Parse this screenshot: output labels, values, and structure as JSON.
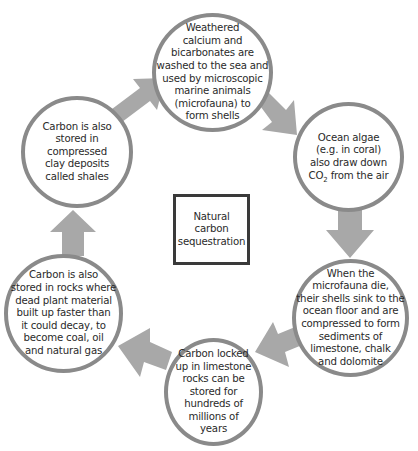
{
  "diagram": {
    "title": "Natural\ncarbon\nsequestration",
    "nodes": [
      {
        "id": "top",
        "text": "Weathered\ncalcium and\nbicarbonates are\nwashed to the sea and\nused by microscopic\nmarine animals\n(microfauna) to\nform shells"
      },
      {
        "id": "right-top",
        "text_before": "Ocean algae\n(e.g. in coral)\nalso draw down\nCO",
        "subscript": "2",
        "text_after": " from the air"
      },
      {
        "id": "right-bottom",
        "text": "When the\nmicrofauna die,\ntheir shells sink to the\nocean floor and are\ncompressed to form\nsediments of\nlimestone, chalk\nand dolomite"
      },
      {
        "id": "bottom",
        "text": "Carbon locked\nup in limestone\nrocks can be\nstored for\nhundreds of\nmillions of\nyears"
      },
      {
        "id": "left-bottom",
        "text": "Carbon is also\nstored in rocks where\ndead plant material\nbuilt up faster than\nit could decay, to\nbecome coal, oil\nand natural gas"
      },
      {
        "id": "left-top",
        "text": "Carbon is also\nstored in compressed\nclay deposits\ncalled shales"
      }
    ],
    "arrows": [
      {
        "from": "left-top",
        "to": "top"
      },
      {
        "from": "top",
        "to": "right-top"
      },
      {
        "from": "right-top",
        "to": "right-bottom"
      },
      {
        "from": "right-bottom",
        "to": "bottom"
      },
      {
        "from": "bottom",
        "to": "left-bottom"
      },
      {
        "from": "left-bottom",
        "to": "left-top"
      }
    ],
    "colors": {
      "arrow": "#a8a8a8",
      "circle_border": "#8a8a8a",
      "box_border": "#3a3a3a",
      "text": "#2a2a2a"
    }
  }
}
